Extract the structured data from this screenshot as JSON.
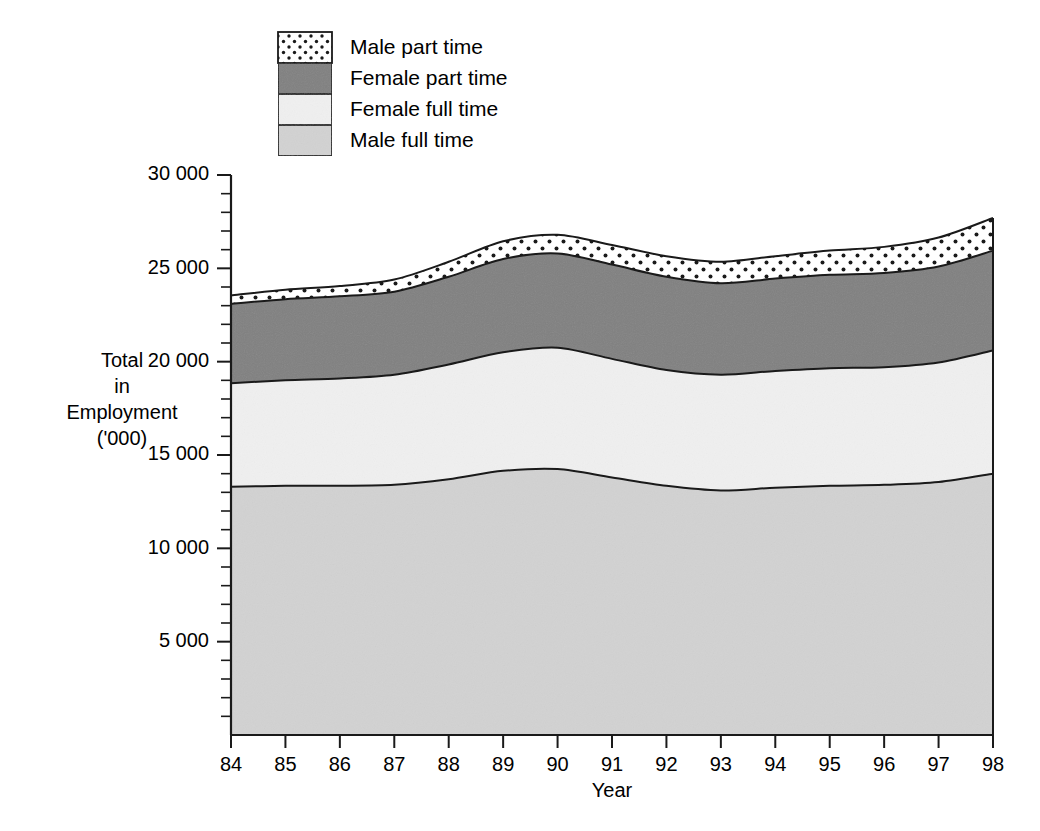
{
  "chart_data": {
    "type": "area",
    "stacked": true,
    "title": "",
    "xlabel": "Year",
    "ylabel": "Total in Employment ('000)",
    "ylabel_lines": [
      "Total",
      "in",
      "Employment",
      "('000)"
    ],
    "categories": [
      "84",
      "85",
      "86",
      "87",
      "88",
      "89",
      "90",
      "91",
      "92",
      "93",
      "94",
      "95",
      "96",
      "97",
      "98"
    ],
    "x": [
      1984,
      1985,
      1986,
      1987,
      1988,
      1989,
      1990,
      1991,
      1992,
      1993,
      1994,
      1995,
      1996,
      1997,
      1998
    ],
    "ylim": [
      0,
      30000
    ],
    "ytick_labels": [
      "5 000",
      "10 000",
      "15 000",
      "20 000",
      "25 000",
      "30 000"
    ],
    "ytick_values": [
      5000,
      10000,
      15000,
      20000,
      25000,
      30000
    ],
    "yminor_step": 1000,
    "grid": false,
    "legend_position": "top-center",
    "series": [
      {
        "name": "Male full time",
        "fill_style": "light-gray",
        "color": "#d2d2d2",
        "values": [
          13300,
          13350,
          13350,
          13400,
          13700,
          14150,
          14250,
          13800,
          13350,
          13100,
          13250,
          13350,
          13400,
          13550,
          14000
        ]
      },
      {
        "name": "Female full time",
        "fill_style": "near-white",
        "color": "#f0f0f0",
        "values": [
          5550,
          5650,
          5750,
          5900,
          6150,
          6350,
          6500,
          6350,
          6200,
          6200,
          6250,
          6300,
          6300,
          6400,
          6600
        ]
      },
      {
        "name": "Female part time",
        "fill_style": "dark-gray",
        "color": "#808080",
        "values": [
          4250,
          4350,
          4400,
          4450,
          4700,
          5000,
          5050,
          5050,
          5000,
          4900,
          4950,
          5000,
          5050,
          5150,
          5350
        ]
      },
      {
        "name": "Male part time",
        "fill_style": "dotted",
        "color": "#ffffff",
        "values": [
          450,
          500,
          550,
          650,
          800,
          950,
          1000,
          1050,
          1100,
          1150,
          1200,
          1300,
          1400,
          1550,
          1750
        ]
      }
    ],
    "stack_tops": {
      "male_full_time": [
        13300,
        13350,
        13350,
        13400,
        13700,
        14150,
        14250,
        13800,
        13350,
        13100,
        13250,
        13350,
        13400,
        13550,
        14000
      ],
      "female_full_time": [
        18850,
        19000,
        19100,
        19300,
        19850,
        20500,
        20750,
        20150,
        19550,
        19300,
        19500,
        19650,
        19700,
        19950,
        20600
      ],
      "female_part_time": [
        23100,
        23350,
        23500,
        23750,
        24550,
        25500,
        25800,
        25200,
        24550,
        24200,
        24450,
        24650,
        24750,
        25100,
        25950
      ],
      "male_part_time": [
        23550,
        23850,
        24050,
        24400,
        25350,
        26450,
        26800,
        26250,
        25650,
        25350,
        25650,
        25950,
        26150,
        26650,
        27700
      ]
    }
  },
  "legend": {
    "items": [
      {
        "label": "Male part time",
        "swatch": "dotted"
      },
      {
        "label": "Female part time",
        "swatch": "dark-gray"
      },
      {
        "label": "Female full time",
        "swatch": "near-white"
      },
      {
        "label": "Male full time",
        "swatch": "light-gray"
      }
    ]
  },
  "axes": {
    "x_title": "Year",
    "y_title_lines": [
      "Total",
      "in",
      "Employment",
      "('000)"
    ],
    "x_ticks": [
      "84",
      "85",
      "86",
      "87",
      "88",
      "89",
      "90",
      "91",
      "92",
      "93",
      "94",
      "95",
      "96",
      "97",
      "98"
    ],
    "y_ticks": [
      "30 000",
      "25 000",
      "20 000",
      "15 000",
      "10 000",
      "5 000"
    ]
  },
  "colors": {
    "male_full_time": "#d2d2d2",
    "female_full_time": "#f0f0f0",
    "female_part_time": "#808080",
    "male_part_time": "#ffffff",
    "outline": "#1a1a1a",
    "background": "#ffffff"
  }
}
